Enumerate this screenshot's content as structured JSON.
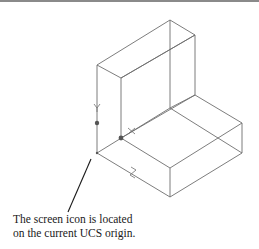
{
  "figure": {
    "caption_lines": [
      "The screen icon is located",
      "on the current UCS origin."
    ],
    "axis_labels": {
      "x": "X",
      "y": "Y",
      "z": "Z"
    },
    "colors": {
      "line": "#6e6e6e",
      "leader": "#1a1a1a",
      "text": "#1a1a1a",
      "rule": "#8a8a8a"
    }
  }
}
